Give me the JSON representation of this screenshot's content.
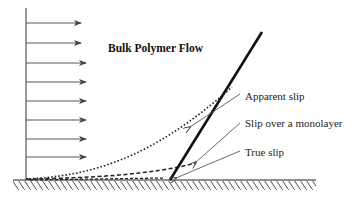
{
  "diagram": {
    "title": "Bulk Polymer Flow",
    "labels": {
      "apparent_slip": "Apparent slip",
      "monolayer_slip": "Slip over a monolayer",
      "true_slip": "True slip"
    },
    "colors": {
      "line": "#111111",
      "arrow": "#444444",
      "text": "#222222",
      "background": "#ffffff"
    }
  }
}
